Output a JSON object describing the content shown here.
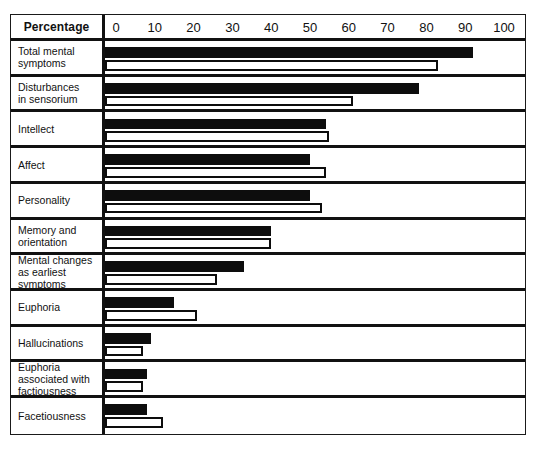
{
  "header": {
    "label": "Percentage"
  },
  "chart_data": {
    "type": "bar",
    "title": "",
    "xlabel": "Percentage",
    "ylabel": "",
    "xlim": [
      0,
      100
    ],
    "grid": false,
    "legend_position": "none",
    "orientation": "horizontal",
    "tick_labels": [
      "0",
      "10",
      "20",
      "30",
      "40",
      "50",
      "60",
      "70",
      "80",
      "90",
      "100"
    ],
    "ticks": [
      0,
      10,
      20,
      30,
      40,
      50,
      60,
      70,
      80,
      90,
      100
    ],
    "categories": [
      "Total mental symptoms",
      "Disturbances in sensorium",
      "Intellect",
      "Affect",
      "Personality",
      "Memory and orientation",
      "Mental changes as earliest symptoms",
      "Euphoria",
      "Hallucinations",
      "Euphoria associated with factiousness",
      "Facetiousness"
    ],
    "category_lines": [
      [
        "Total mental",
        "symptoms"
      ],
      [
        "Disturbances",
        "in sensorium"
      ],
      [
        "Intellect"
      ],
      [
        "Affect"
      ],
      [
        "Personality"
      ],
      [
        "Memory and",
        "orientation"
      ],
      [
        "Mental changes",
        "as earliest",
        "symptoms"
      ],
      [
        "Euphoria"
      ],
      [
        "Hallucinations"
      ],
      [
        "Euphoria",
        "associated with",
        "factiousness"
      ],
      [
        "Facetiousness"
      ]
    ],
    "series": [
      {
        "name": "solid",
        "style": "filled-black",
        "color": "#0d0d0d",
        "values": [
          92,
          78,
          54,
          50,
          50,
          40,
          33,
          15,
          9,
          8,
          8
        ]
      },
      {
        "name": "hollow",
        "style": "white-outlined",
        "color": "#ffffff",
        "values": [
          83,
          61,
          55,
          54,
          53,
          40,
          26,
          21,
          7,
          7,
          12
        ]
      }
    ]
  },
  "colors": {
    "ink": "#0d0d0d",
    "paper": "#ffffff"
  }
}
